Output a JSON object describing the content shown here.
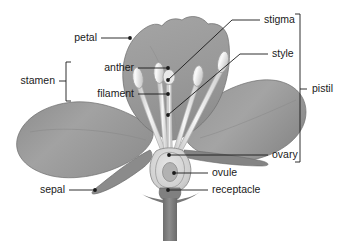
{
  "figure": {
    "kind": "botanical-diagram",
    "background_color": "#ffffff",
    "line_color": "#1a1a1a",
    "text_color": "#1a1a1a"
  },
  "palette": {
    "petal_fill": "#9a9a9a",
    "petal_fill_light": "#a8a8a8",
    "petal_fill_dark": "#8a8a8a",
    "petal_outline": "#6e6e6e",
    "sepal_fill": "#8f8f8f",
    "stem_fill": "#787878",
    "filament_fill": "#efefef",
    "filament_outline": "#b4b4b4",
    "anther_fill": "#f2f2f2",
    "anther_outline": "#9e9e9e",
    "ovary_fill": "#d8d8d8",
    "ovule_fill": "#b0b0b0",
    "top_petal_fill": "#9d9d9d"
  },
  "labels": [
    {
      "id": "petal",
      "text": "petal",
      "x": 97,
      "y": 41,
      "align": "end",
      "dot": {
        "x": 130,
        "y": 38
      },
      "leader": [
        [
          101,
          38
        ],
        [
          130,
          38
        ]
      ]
    },
    {
      "id": "stamen",
      "text": "stamen",
      "x": 55,
      "y": 84,
      "align": "end",
      "dot": null,
      "leader": [
        [
          59,
          81
        ],
        [
          66,
          81
        ]
      ]
    },
    {
      "id": "anther",
      "text": "anther",
      "x": 134,
      "y": 71,
      "align": "end",
      "dot": {
        "x": 168,
        "y": 68
      },
      "leader": [
        [
          138,
          68
        ],
        [
          168,
          68
        ]
      ]
    },
    {
      "id": "filament",
      "text": "filament",
      "x": 134,
      "y": 97,
      "align": "end",
      "dot": {
        "x": 168,
        "y": 94
      },
      "leader": [
        [
          138,
          94
        ],
        [
          168,
          94
        ]
      ]
    },
    {
      "id": "stigma",
      "text": "stigma",
      "x": 264,
      "y": 23,
      "align": "start",
      "dot": {
        "x": 168,
        "y": 80
      },
      "leader": [
        [
          260,
          20
        ],
        [
          232,
          20
        ],
        [
          168,
          80
        ]
      ]
    },
    {
      "id": "style",
      "text": "style",
      "x": 272,
      "y": 57,
      "align": "start",
      "dot": {
        "x": 168,
        "y": 115
      },
      "leader": [
        [
          268,
          54
        ],
        [
          240,
          54
        ],
        [
          168,
          115
        ]
      ]
    },
    {
      "id": "pistil",
      "text": "pistil",
      "x": 312,
      "y": 92,
      "align": "start",
      "dot": null,
      "leader": [
        [
          300,
          89
        ],
        [
          307,
          89
        ]
      ]
    },
    {
      "id": "ovary",
      "text": "ovary",
      "x": 272,
      "y": 158,
      "align": "start",
      "dot": {
        "x": 169,
        "y": 155
      },
      "leader": [
        [
          268,
          155
        ],
        [
          169,
          155
        ]
      ]
    },
    {
      "id": "ovule",
      "text": "ovule",
      "x": 212,
      "y": 176,
      "align": "start",
      "dot": {
        "x": 174,
        "y": 173
      },
      "leader": [
        [
          208,
          173
        ],
        [
          174,
          173
        ]
      ]
    },
    {
      "id": "receptacle",
      "text": "receptacle",
      "x": 212,
      "y": 193,
      "align": "start",
      "dot": {
        "x": 168,
        "y": 190
      },
      "leader": [
        [
          208,
          190
        ],
        [
          168,
          190
        ]
      ]
    },
    {
      "id": "sepal",
      "text": "sepal",
      "x": 65,
      "y": 193,
      "align": "end",
      "dot": {
        "x": 95,
        "y": 190
      },
      "leader": [
        [
          69,
          190
        ],
        [
          95,
          190
        ]
      ]
    }
  ],
  "brackets": [
    {
      "id": "stamen-bracket",
      "groups": [
        "anther",
        "filament"
      ],
      "x": 66,
      "y_top": 62,
      "y_bottom": 101,
      "tick": 5,
      "opens": "right"
    },
    {
      "id": "pistil-bracket",
      "groups": [
        "stigma",
        "style",
        "ovary"
      ],
      "x": 300,
      "y_top": 14,
      "y_bottom": 162,
      "tick": 5,
      "opens": "left"
    }
  ],
  "parts": [
    {
      "id": "top-petal",
      "name": "petal",
      "note": "upper broad petal with notched margin"
    },
    {
      "id": "left-petal",
      "name": "petal",
      "note": "large left lateral petal"
    },
    {
      "id": "right-petal",
      "name": "petal",
      "note": "large right lateral petal"
    },
    {
      "id": "sepal-part",
      "name": "sepal",
      "note": "pointed green bract below left petal"
    },
    {
      "id": "stamen-1",
      "name": "stamen",
      "note": "anther on filament, far left"
    },
    {
      "id": "stamen-2",
      "name": "stamen",
      "note": "anther on filament, left-centre"
    },
    {
      "id": "stamen-3",
      "name": "stamen",
      "note": "anther on filament, right-centre"
    },
    {
      "id": "stamen-4",
      "name": "stamen",
      "note": "anther on filament, far right"
    },
    {
      "id": "pistil-part",
      "name": "pistil",
      "note": "stigma + style + ovary, central"
    },
    {
      "id": "ovary-part",
      "name": "ovary",
      "note": "swollen base containing ovule"
    },
    {
      "id": "ovule-part",
      "name": "ovule",
      "note": "oval body inside ovary"
    },
    {
      "id": "receptacle-part",
      "name": "receptacle",
      "note": "thickened stem top below ovary"
    },
    {
      "id": "stem-part",
      "name": "stem",
      "note": "peduncle running to bottom edge"
    }
  ]
}
